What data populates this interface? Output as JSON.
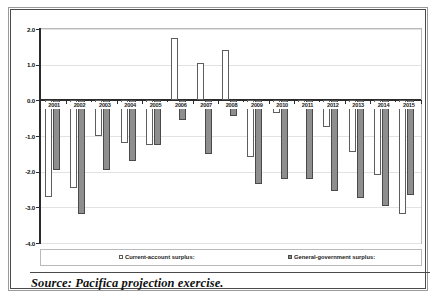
{
  "chart_data": {
    "type": "bar",
    "title": "",
    "xlabel": "",
    "ylabel": "",
    "ylim": [
      -4.0,
      2.0
    ],
    "grid": true,
    "legend_position": "bottom",
    "categories": [
      "2001",
      "2002",
      "2003",
      "2004",
      "2005",
      "2006",
      "2007",
      "2008",
      "2009",
      "2010",
      "2011",
      "2012",
      "2013",
      "2014",
      "2015"
    ],
    "ytick_labels": [
      "2.0",
      "1.0",
      "0.0",
      "-1.0",
      "-2.0",
      "-3.0",
      "-4.0"
    ],
    "ytick_values": [
      2.0,
      1.0,
      0.0,
      -1.0,
      -2.0,
      -3.0,
      -4.0
    ],
    "series": [
      {
        "name": "Current-account surplus:",
        "color": "#ffffff",
        "edge_color": "#5d5d5d",
        "values": [
          -2.7,
          -2.45,
          -1.0,
          -1.2,
          -1.25,
          1.75,
          1.05,
          1.4,
          -1.6,
          -0.35,
          -0.2,
          -0.75,
          -1.45,
          -2.1,
          -3.2
        ]
      },
      {
        "name": "General-government surplus:",
        "color": "#8e8e8e",
        "edge_color": "#4a4a4a",
        "values": [
          -1.95,
          -3.2,
          -1.95,
          -1.7,
          -1.25,
          -0.55,
          -1.5,
          -0.45,
          -2.35,
          -2.2,
          -2.2,
          -2.55,
          -2.75,
          -2.95,
          -2.65
        ]
      }
    ]
  },
  "legend": {
    "items": [
      {
        "label": "Current-account surplus:",
        "marker": "open-square-marker"
      },
      {
        "label": "General-government surplus:",
        "marker": "filled-square-marker"
      }
    ]
  },
  "source": {
    "text": "Source: Pacifica projection exercise."
  }
}
